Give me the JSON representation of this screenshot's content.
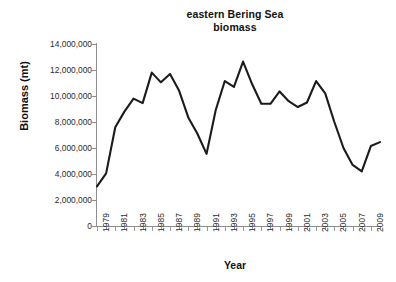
{
  "chart_data": {
    "type": "line",
    "title": "eastern Bering Sea biomass",
    "title_lines": [
      "eastern Bering Sea",
      "biomass"
    ],
    "xlabel": "Year",
    "ylabel": "Biomass (mt)",
    "xlim": [
      1979,
      2010
    ],
    "ylim": [
      0,
      14000000
    ],
    "ytick_values": [
      0,
      2000000,
      4000000,
      6000000,
      8000000,
      10000000,
      12000000,
      14000000
    ],
    "ytick_labels": [
      "0",
      "2,000,000",
      "4,000,000",
      "6,000,000",
      "8,000,000",
      "10,000,000",
      "12,000,000",
      "14,000,000"
    ],
    "xtick_labels": [
      "1979",
      "1981",
      "1983",
      "1985",
      "1987",
      "1989",
      "1991",
      "1993",
      "1995",
      "1997",
      "1999",
      "2001",
      "2003",
      "2005",
      "2007",
      "2009"
    ],
    "xtick_step": 2,
    "xtick_rotation": -90,
    "grid": false,
    "legend": false,
    "line_color": "#1b1b1b",
    "x": [
      1979,
      1980,
      1981,
      1982,
      1983,
      1984,
      1985,
      1986,
      1987,
      1988,
      1989,
      1990,
      1991,
      1992,
      1993,
      1994,
      1995,
      1996,
      1997,
      1998,
      1999,
      2000,
      2001,
      2002,
      2003,
      2004,
      2005,
      2006,
      2007,
      2008,
      2009,
      2010
    ],
    "values": [
      3050000,
      4050000,
      7600000,
      8800000,
      9800000,
      9450000,
      11800000,
      11050000,
      11700000,
      10400000,
      8350000,
      7100000,
      5550000,
      8900000,
      11150000,
      10700000,
      12650000,
      10900000,
      9400000,
      9400000,
      10350000,
      9600000,
      9150000,
      9500000,
      11150000,
      10200000,
      8000000,
      6000000,
      4700000,
      4200000,
      6150000,
      6450000
    ],
    "series_name": "eastern Bering Sea biomass"
  },
  "axis": {
    "y_title": "Biomass (mt)",
    "x_title": "Year"
  }
}
